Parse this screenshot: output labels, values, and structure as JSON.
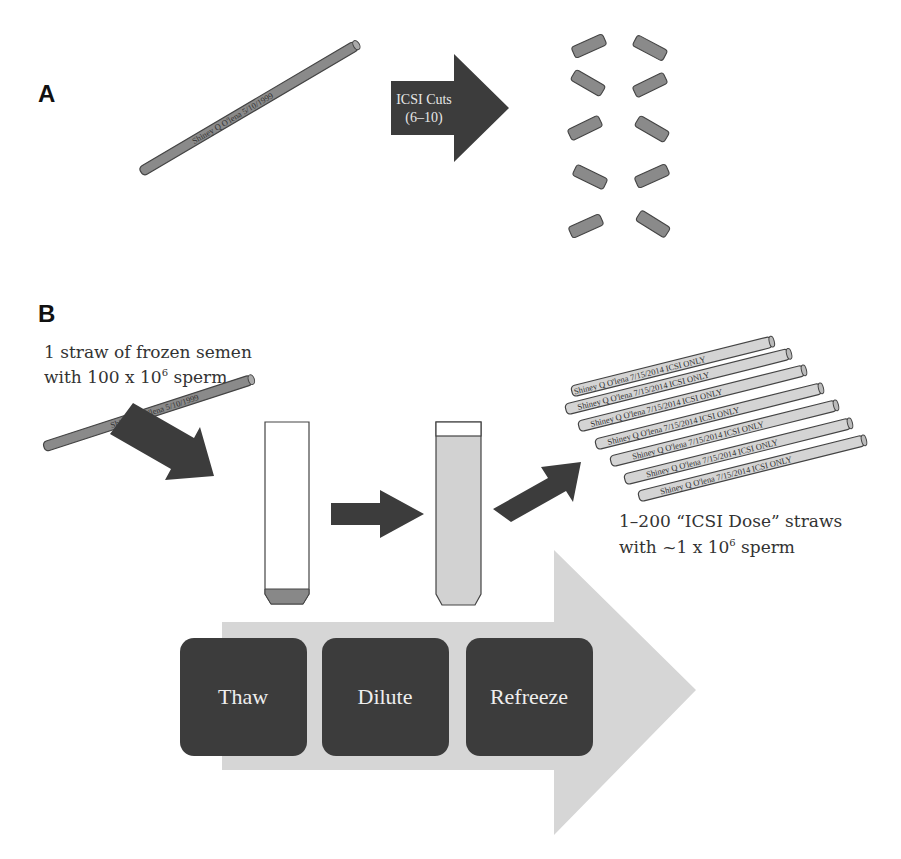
{
  "panel_a": {
    "letter": "A",
    "straw_label": "Shiney Q O'lena  5/10/1999",
    "cut_arrow_line1": "ICSI Cuts",
    "cut_arrow_line2": "(6–10)",
    "cut_pieces_count": 10
  },
  "panel_b": {
    "letter": "B",
    "caption_left_line1": "1 straw of frozen semen",
    "caption_left_line2_prefix": "with 100 x 10",
    "caption_left_line2_sup": "6",
    "caption_left_line2_suffix": " sperm",
    "straw_label": "Shiney Q O'lena  5/10/1999",
    "dose_straw_label": "Shiney Q O'lena  7/15/2014 ICSI ONLY",
    "dose_straw_count": 7,
    "caption_right_line1": "1–200 “ICSI Dose” straws",
    "caption_right_line2_prefix": "with ~1 x 10",
    "caption_right_line2_sup": "6",
    "caption_right_line2_suffix": " sperm",
    "steps": [
      {
        "label": "Thaw"
      },
      {
        "label": "Dilute"
      },
      {
        "label": "Refreeze"
      }
    ]
  },
  "colors": {
    "dark": "#3c3c3c",
    "straw_dark": "#8a8a8a",
    "straw_light": "#d4d4d4",
    "big_arrow": "#d6d6d6",
    "tube_fill": "#d2d2d2",
    "pellet": "#888888"
  }
}
